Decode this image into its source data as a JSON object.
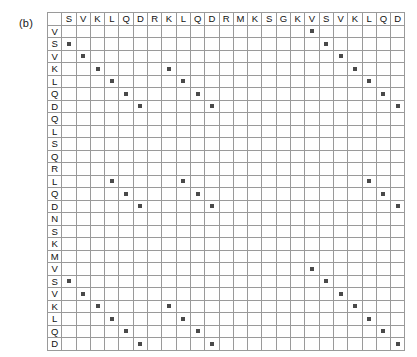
{
  "panel": {
    "label": "(b)"
  },
  "chart_data": {
    "type": "heatmap",
    "title": "",
    "subtitle": "",
    "xlabel": "",
    "ylabel": "",
    "grid": true,
    "legend_position": "none",
    "marker_color": "#4a4a4a",
    "grid_color": "#9a9a9a",
    "background_color": "#ffffff",
    "x_categories": [
      "S",
      "V",
      "K",
      "L",
      "Q",
      "D",
      "R",
      "K",
      "L",
      "Q",
      "D",
      "R",
      "M",
      "K",
      "S",
      "G",
      "K",
      "V",
      "S",
      "V",
      "K",
      "L",
      "Q",
      "D"
    ],
    "y_categories": [
      "V",
      "S",
      "V",
      "K",
      "L",
      "Q",
      "D",
      "Q",
      "L",
      "S",
      "Q",
      "R",
      "L",
      "Q",
      "D",
      "N",
      "S",
      "K",
      "M",
      "V",
      "S",
      "V",
      "K",
      "L",
      "Q",
      "D"
    ],
    "x_sequence": "SVKLQDRKLQDRMKSGKVSVKLQD",
    "y_sequence": "VSVKLQDQLSQRLQDNSKMVSVKLQD",
    "n_columns": 24,
    "n_rows": 26,
    "matrix": [
      [
        0,
        0,
        0,
        0,
        0,
        0,
        0,
        0,
        0,
        0,
        0,
        0,
        0,
        0,
        0,
        0,
        0,
        1,
        0,
        0,
        0,
        0,
        0,
        0
      ],
      [
        1,
        0,
        0,
        0,
        0,
        0,
        0,
        0,
        0,
        0,
        0,
        0,
        0,
        0,
        0,
        0,
        0,
        0,
        1,
        0,
        0,
        0,
        0,
        0
      ],
      [
        0,
        1,
        0,
        0,
        0,
        0,
        0,
        0,
        0,
        0,
        0,
        0,
        0,
        0,
        0,
        0,
        0,
        0,
        0,
        1,
        0,
        0,
        0,
        0
      ],
      [
        0,
        0,
        1,
        0,
        0,
        0,
        0,
        1,
        0,
        0,
        0,
        0,
        0,
        0,
        0,
        0,
        0,
        0,
        0,
        0,
        1,
        0,
        0,
        0
      ],
      [
        0,
        0,
        0,
        1,
        0,
        0,
        0,
        0,
        1,
        0,
        0,
        0,
        0,
        0,
        0,
        0,
        0,
        0,
        0,
        0,
        0,
        1,
        0,
        0
      ],
      [
        0,
        0,
        0,
        0,
        1,
        0,
        0,
        0,
        0,
        1,
        0,
        0,
        0,
        0,
        0,
        0,
        0,
        0,
        0,
        0,
        0,
        0,
        1,
        0
      ],
      [
        0,
        0,
        0,
        0,
        0,
        1,
        0,
        0,
        0,
        0,
        1,
        0,
        0,
        0,
        0,
        0,
        0,
        0,
        0,
        0,
        0,
        0,
        0,
        1
      ],
      [
        0,
        0,
        0,
        0,
        0,
        0,
        0,
        0,
        0,
        0,
        0,
        0,
        0,
        0,
        0,
        0,
        0,
        0,
        0,
        0,
        0,
        0,
        0,
        0
      ],
      [
        0,
        0,
        0,
        0,
        0,
        0,
        0,
        0,
        0,
        0,
        0,
        0,
        0,
        0,
        0,
        0,
        0,
        0,
        0,
        0,
        0,
        0,
        0,
        0
      ],
      [
        0,
        0,
        0,
        0,
        0,
        0,
        0,
        0,
        0,
        0,
        0,
        0,
        0,
        0,
        0,
        0,
        0,
        0,
        0,
        0,
        0,
        0,
        0,
        0
      ],
      [
        0,
        0,
        0,
        0,
        0,
        0,
        0,
        0,
        0,
        0,
        0,
        0,
        0,
        0,
        0,
        0,
        0,
        0,
        0,
        0,
        0,
        0,
        0,
        0
      ],
      [
        0,
        0,
        0,
        0,
        0,
        0,
        0,
        0,
        0,
        0,
        0,
        0,
        0,
        0,
        0,
        0,
        0,
        0,
        0,
        0,
        0,
        0,
        0,
        0
      ],
      [
        0,
        0,
        0,
        1,
        0,
        0,
        0,
        0,
        1,
        0,
        0,
        0,
        0,
        0,
        0,
        0,
        0,
        0,
        0,
        0,
        0,
        1,
        0,
        0
      ],
      [
        0,
        0,
        0,
        0,
        1,
        0,
        0,
        0,
        0,
        1,
        0,
        0,
        0,
        0,
        0,
        0,
        0,
        0,
        0,
        0,
        0,
        0,
        1,
        0
      ],
      [
        0,
        0,
        0,
        0,
        0,
        1,
        0,
        0,
        0,
        0,
        1,
        0,
        0,
        0,
        0,
        0,
        0,
        0,
        0,
        0,
        0,
        0,
        0,
        1
      ],
      [
        0,
        0,
        0,
        0,
        0,
        0,
        0,
        0,
        0,
        0,
        0,
        0,
        0,
        0,
        0,
        0,
        0,
        0,
        0,
        0,
        0,
        0,
        0,
        0
      ],
      [
        0,
        0,
        0,
        0,
        0,
        0,
        0,
        0,
        0,
        0,
        0,
        0,
        0,
        0,
        0,
        0,
        0,
        0,
        0,
        0,
        0,
        0,
        0,
        0
      ],
      [
        0,
        0,
        0,
        0,
        0,
        0,
        0,
        0,
        0,
        0,
        0,
        0,
        0,
        0,
        0,
        0,
        0,
        0,
        0,
        0,
        0,
        0,
        0,
        0
      ],
      [
        0,
        0,
        0,
        0,
        0,
        0,
        0,
        0,
        0,
        0,
        0,
        0,
        0,
        0,
        0,
        0,
        0,
        0,
        0,
        0,
        0,
        0,
        0,
        0
      ],
      [
        0,
        0,
        0,
        0,
        0,
        0,
        0,
        0,
        0,
        0,
        0,
        0,
        0,
        0,
        0,
        0,
        0,
        1,
        0,
        0,
        0,
        0,
        0,
        0
      ],
      [
        1,
        0,
        0,
        0,
        0,
        0,
        0,
        0,
        0,
        0,
        0,
        0,
        0,
        0,
        0,
        0,
        0,
        0,
        1,
        0,
        0,
        0,
        0,
        0
      ],
      [
        0,
        1,
        0,
        0,
        0,
        0,
        0,
        0,
        0,
        0,
        0,
        0,
        0,
        0,
        0,
        0,
        0,
        0,
        0,
        1,
        0,
        0,
        0,
        0
      ],
      [
        0,
        0,
        1,
        0,
        0,
        0,
        0,
        1,
        0,
        0,
        0,
        0,
        0,
        0,
        0,
        0,
        0,
        0,
        0,
        0,
        1,
        0,
        0,
        0
      ],
      [
        0,
        0,
        0,
        1,
        0,
        0,
        0,
        0,
        1,
        0,
        0,
        0,
        0,
        0,
        0,
        0,
        0,
        0,
        0,
        0,
        0,
        1,
        0,
        0
      ],
      [
        0,
        0,
        0,
        0,
        1,
        0,
        0,
        0,
        0,
        1,
        0,
        0,
        0,
        0,
        0,
        0,
        0,
        0,
        0,
        0,
        0,
        0,
        1,
        0
      ],
      [
        0,
        0,
        0,
        0,
        0,
        1,
        0,
        0,
        0,
        0,
        1,
        0,
        0,
        0,
        0,
        0,
        0,
        0,
        0,
        0,
        0,
        0,
        0,
        1
      ]
    ]
  }
}
